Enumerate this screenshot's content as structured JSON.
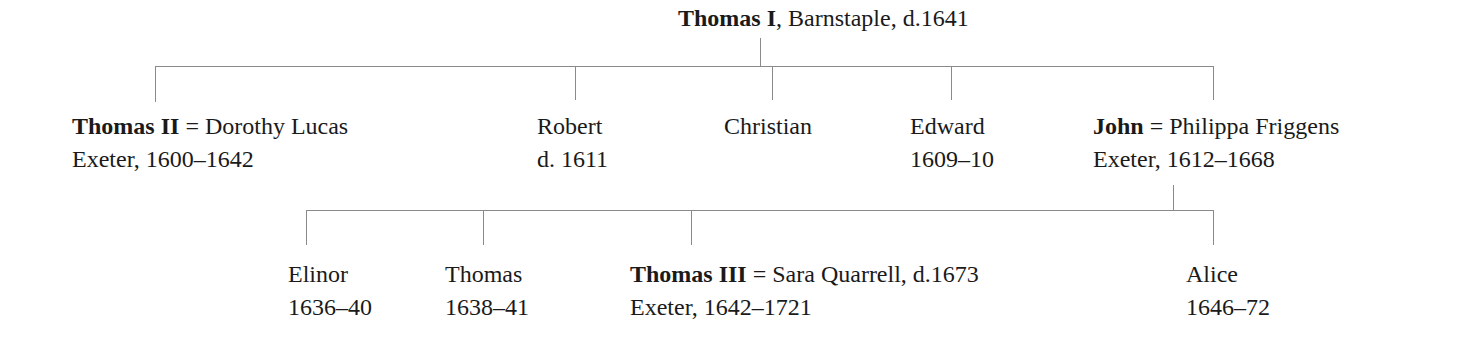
{
  "root": {
    "name": "Thomas I",
    "detail": ", Barnstaple, d.1641"
  },
  "generation2": [
    {
      "name": "Thomas II",
      "spouse": " = Dorothy Lucas",
      "line2": "Exeter, 1600–1642"
    },
    {
      "name": "Robert",
      "line2": "d. 1611"
    },
    {
      "name": "Christian",
      "line2": ""
    },
    {
      "name": "Edward",
      "line2": "1609–10"
    },
    {
      "name": "John",
      "spouse": " = Philippa Friggens",
      "line2": "Exeter, 1612–1668"
    }
  ],
  "generation3": [
    {
      "name": "Elinor",
      "line2": "1636–40"
    },
    {
      "name": "Thomas",
      "line2": "1638–41"
    },
    {
      "name": "Thomas III",
      "spouse": " = Sara Quarrell, d.1673",
      "line2": "Exeter, 1642–1721"
    },
    {
      "name": "Alice",
      "line2": "1646–72"
    }
  ],
  "colors": {
    "line": "#8a8a8a",
    "text": "#1a1a1a"
  }
}
